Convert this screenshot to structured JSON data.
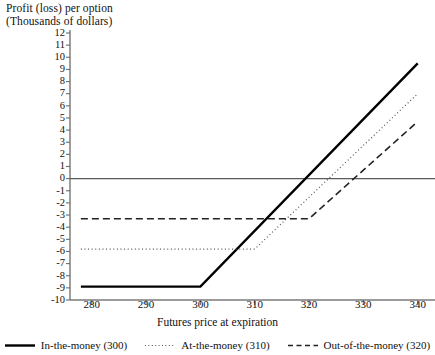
{
  "chart_data": {
    "type": "line",
    "title": "Profit (loss) per option (Thousands of dollars)",
    "title_line1": "Profit (loss) per option",
    "title_line2": "(Thousands of dollars)",
    "xlabel": "Futures price at expiration",
    "ylabel": "Profit (loss) per option (Thousands of dollars)",
    "xlim": [
      276,
      343
    ],
    "ylim": [
      -10,
      12
    ],
    "xticks": [
      280,
      290,
      300,
      310,
      320,
      330,
      340
    ],
    "yticks": [
      12,
      11,
      10,
      9,
      8,
      7,
      6,
      5,
      4,
      3,
      2,
      1,
      0,
      -1,
      -2,
      -3,
      -4,
      -5,
      -6,
      -7,
      -8,
      -9,
      -10
    ],
    "grid": false,
    "zero_line": 0,
    "legend_position": "bottom",
    "series": [
      {
        "name": "In-the-money (300)",
        "style": "solid",
        "color": "#000000",
        "strike": 300,
        "premium": -8.9,
        "x": [
          278,
          300,
          340
        ],
        "y": [
          -8.9,
          -8.9,
          9.5
        ]
      },
      {
        "name": "At-the-money (310)",
        "style": "dotted",
        "color": "#555555",
        "strike": 310,
        "premium": -5.8,
        "x": [
          278,
          310,
          340
        ],
        "y": [
          -5.8,
          -5.8,
          7.0
        ]
      },
      {
        "name": "Out-of-the-money (320)",
        "style": "dashed",
        "color": "#222222",
        "strike": 320,
        "premium": -3.3,
        "x": [
          278,
          320,
          340
        ],
        "y": [
          -3.3,
          -3.3,
          4.7
        ]
      }
    ]
  },
  "axis": {
    "y_title_line1": "Profit (loss) per option",
    "y_title_line2": "(Thousands of dollars)",
    "x_title": "Futures price at expiration"
  },
  "legend": {
    "items": [
      {
        "label": "In-the-money (300)",
        "style": "solid"
      },
      {
        "label": "At-the-money (310)",
        "style": "dotted"
      },
      {
        "label": "Out-of-the-money (320)",
        "style": "dashed"
      }
    ]
  }
}
